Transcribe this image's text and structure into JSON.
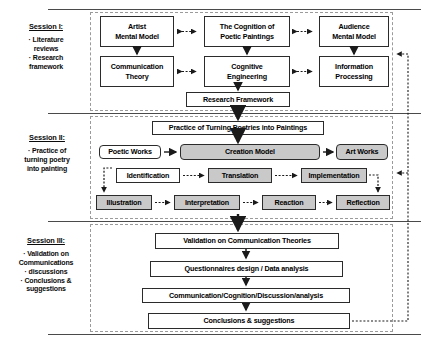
{
  "diagram": {
    "sessions": [
      {
        "id": "session-1",
        "title": "Session I:",
        "bullets": [
          "· Literature reviews",
          "· Research framework"
        ],
        "bullet_lines": [
          [
            "· Literature",
            "reviews"
          ],
          [
            "· Research",
            "framework"
          ]
        ],
        "nodes": [
          {
            "key": "artist_mental_model",
            "label": "Artist\nMental Model"
          },
          {
            "key": "cognition_poetic_paintings",
            "label": "The Cognition of\nPoetic Paintings"
          },
          {
            "key": "audience_mental_model",
            "label": "Audience\nMental Model"
          },
          {
            "key": "communication_theory",
            "label": "Communication\nTheory"
          },
          {
            "key": "cognitive_engineering",
            "label": "Cognitive\nEngineering"
          },
          {
            "key": "information_processing",
            "label": "Information\nProcessing"
          },
          {
            "key": "research_framework",
            "label": "Research Framework"
          }
        ]
      },
      {
        "id": "session-2",
        "title": "Session II:",
        "bullet_lines": [
          [
            "· Practice of",
            "turning poetry",
            "into painting"
          ]
        ],
        "nodes": [
          {
            "key": "practice_turning",
            "label": "Practice of Turning Poetries into Paintings"
          },
          {
            "key": "poetic_works",
            "label": "Poetic Works"
          },
          {
            "key": "creation_model",
            "label": "Creation Model"
          },
          {
            "key": "art_works",
            "label": "Art Works"
          },
          {
            "key": "identification",
            "label": "Identification"
          },
          {
            "key": "translation",
            "label": "Translation"
          },
          {
            "key": "implementation",
            "label": "Implementation"
          },
          {
            "key": "illustration",
            "label": "Illustration"
          },
          {
            "key": "interpretation",
            "label": "Interpretation"
          },
          {
            "key": "reaction",
            "label": "Reaction"
          },
          {
            "key": "reflection",
            "label": "Reflection"
          }
        ]
      },
      {
        "id": "session-3",
        "title": "Session III:",
        "bullet_lines": [
          [
            "· Validation on",
            "Communications"
          ],
          [
            "· discussions"
          ],
          [
            "· Conclusions &",
            "suggestions"
          ]
        ],
        "nodes": [
          {
            "key": "validation_comm_theories",
            "label": "Validation on Communication Theories"
          },
          {
            "key": "questionnaires_design",
            "label": "Questionnaires  design / Data analysis"
          },
          {
            "key": "comm_cog_disc_analysis",
            "label": "Communication/Cognition/Discussion/analysis"
          },
          {
            "key": "conclusions_suggestions",
            "label": "Conclusions & suggestions"
          }
        ]
      }
    ],
    "colors": {
      "gray_fill": "#c9c9c9",
      "box_border": "#2b2b2b",
      "dashed_container": "#9a9a9a",
      "rule": "#4a4a4a",
      "text": "#000000"
    }
  }
}
